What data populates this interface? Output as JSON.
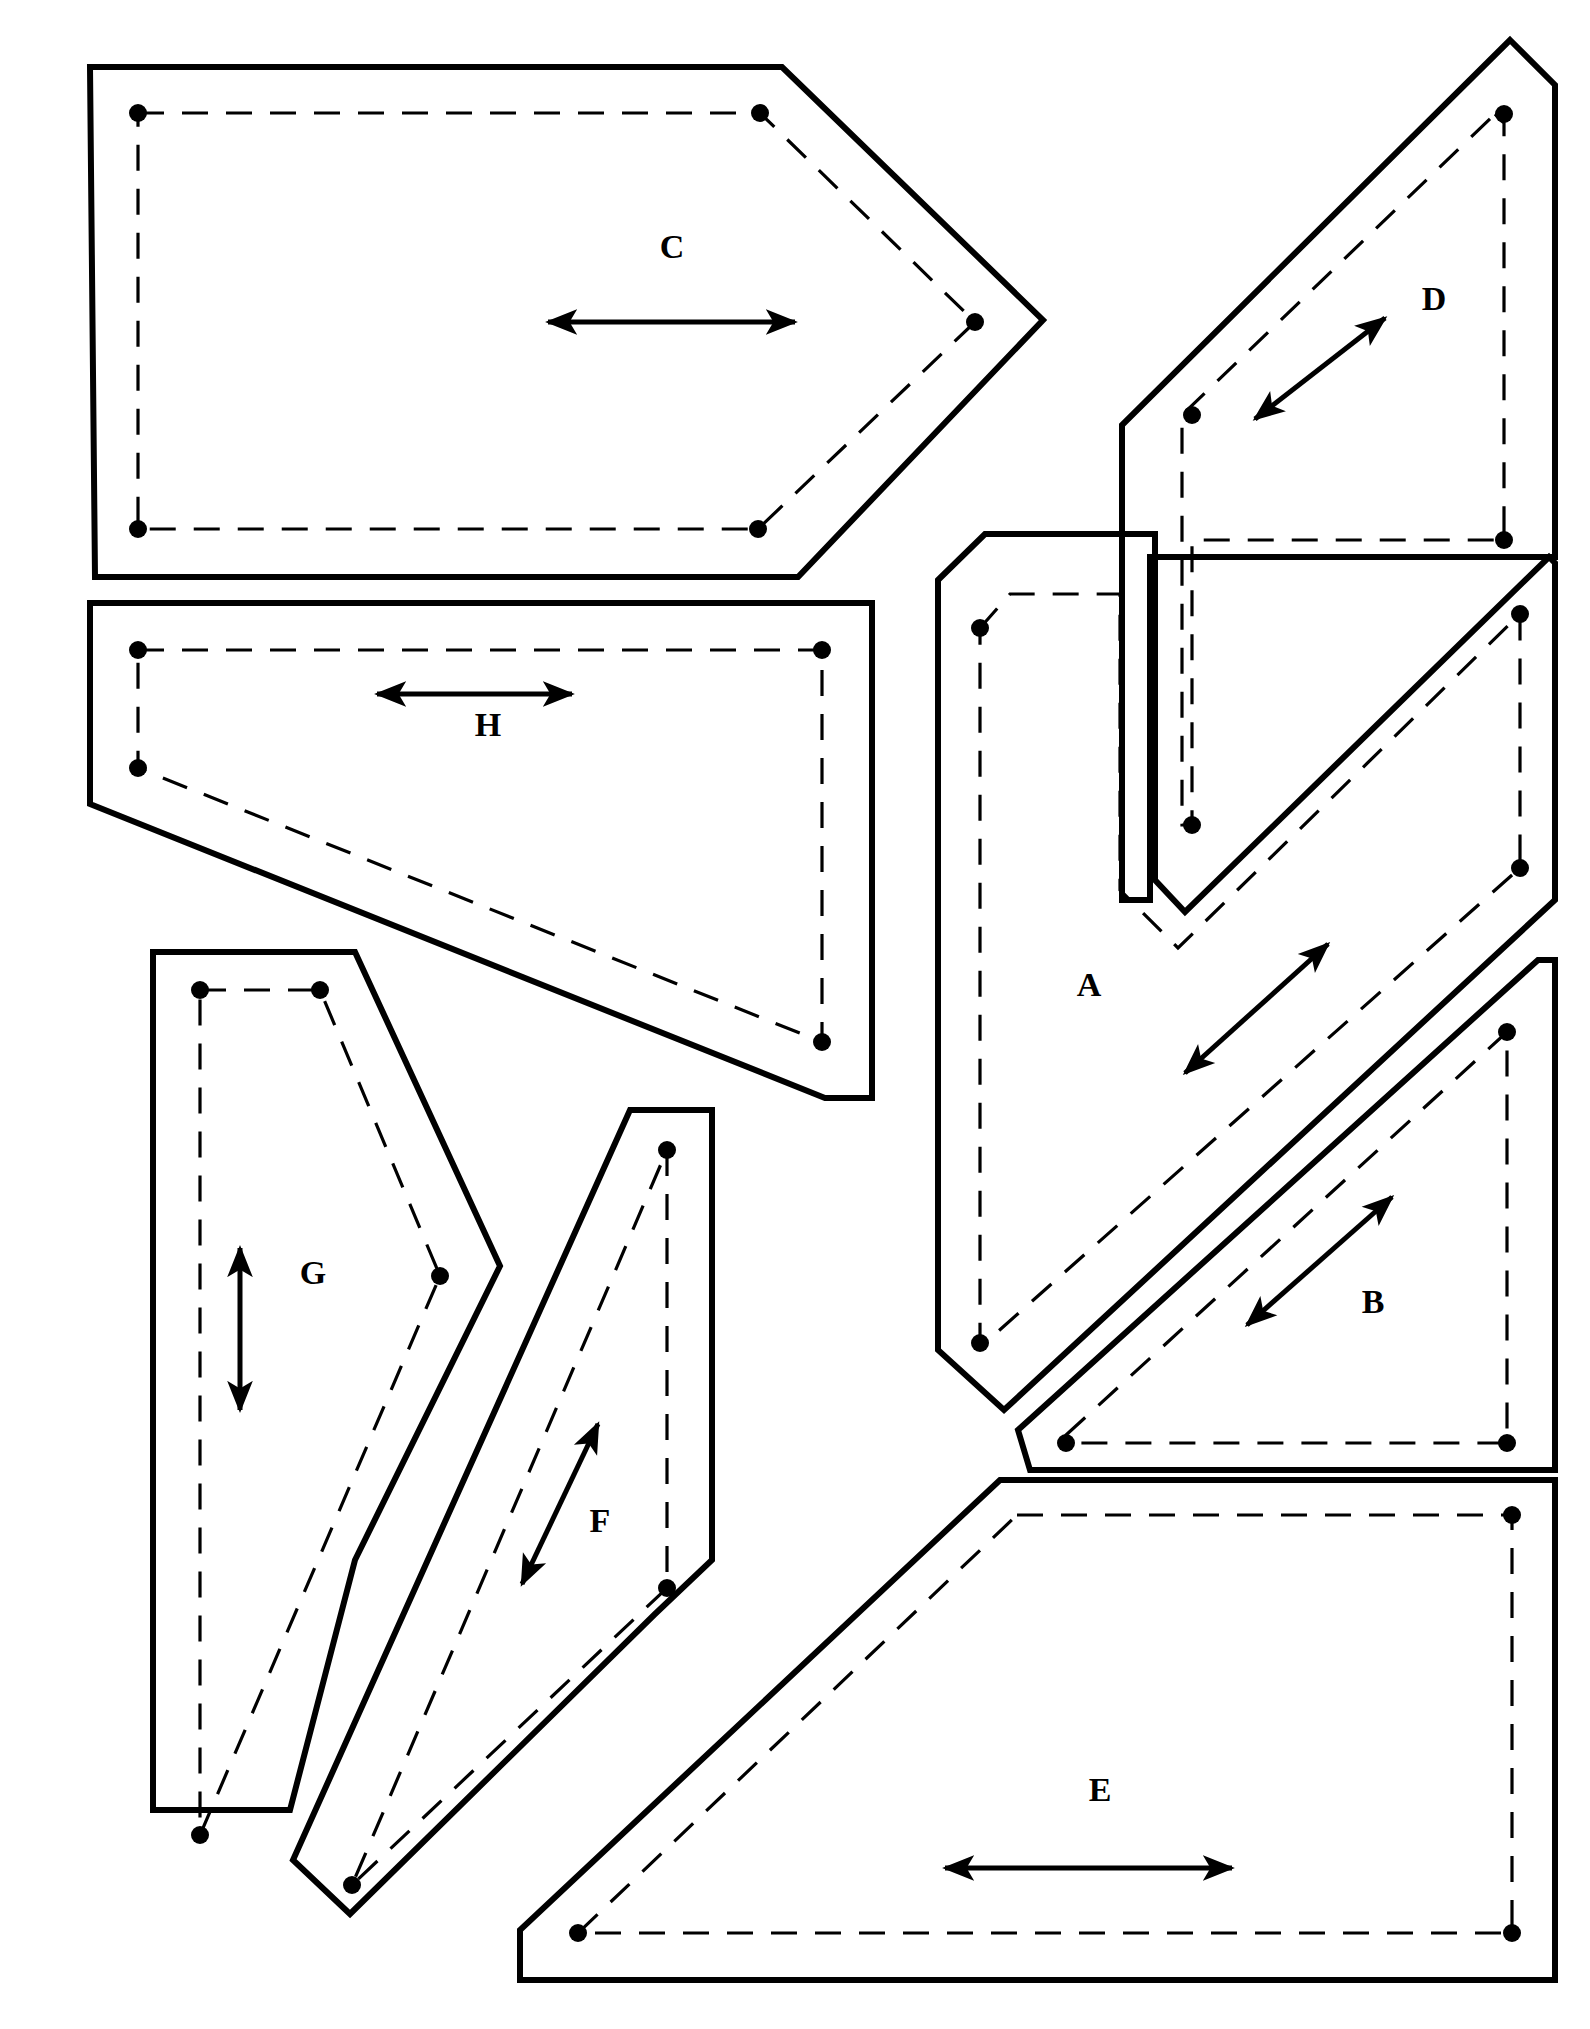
{
  "document": {
    "title": "Pattern Piece Cutting Layout",
    "background_color": "#ffffff",
    "line_color": "#000000",
    "width": 1590,
    "height": 2029
  },
  "legend": {
    "cut_line_style": "solid-heavy",
    "seam_line_style": "dashed",
    "marker_style": "filled-dot",
    "grain_line_style": "double-headed-arrow"
  },
  "pieces": [
    {
      "id": "C",
      "label": "C",
      "label_pos": {
        "x": 672,
        "y": 250
      },
      "cut_outline": "M 90,67 L 782,67 L 1043,320 L 798,577 L 95,577 Z",
      "seam_outline": "M 138,113 L 760,113 L 975,322 L 758,529 L 138,529 Z",
      "notches": [
        {
          "x": 138,
          "y": 113
        },
        {
          "x": 760,
          "y": 113
        },
        {
          "x": 975,
          "y": 322
        },
        {
          "x": 758,
          "y": 529
        },
        {
          "x": 138,
          "y": 529
        }
      ],
      "grain_arrow": {
        "x1": 548,
        "y1": 322,
        "x2": 795,
        "y2": 322
      }
    },
    {
      "id": "D",
      "label": "D",
      "label_pos": {
        "x": 1434,
        "y": 302
      },
      "cut_outline": "M 1510,40 L 1555,85 L 1555,557 L 1150,557 L 1150,900 L 1122,900 L 1122,425 Z",
      "seam_outline": "M 1495,114 L 1504,123 L 1504,540 L 1192,540 L 1192,825 L 1182,825 L 1182,415 Z",
      "notches": [
        {
          "x": 1504,
          "y": 114
        },
        {
          "x": 1504,
          "y": 540
        },
        {
          "x": 1192,
          "y": 415
        },
        {
          "x": 1192,
          "y": 825
        }
      ],
      "grain_arrow": {
        "x1": 1255,
        "y1": 419,
        "x2": 1385,
        "y2": 318
      }
    },
    {
      "id": "A",
      "label": "A",
      "label_pos": {
        "x": 1089,
        "y": 988
      },
      "cut_outline": "M 938,580 L 985,534 L 1155,534 L 1155,880 L 1185,912 L 1549,557 L 1555,563 L 1555,900 L 1004,1410 L 938,1350 Z",
      "seam_outline": "M 980,628 L 1010,594 L 1120,594 L 1120,890 L 1178,948 L 1520,614 L 1520,868 L 985,1343 L 980,1343 Z",
      "notches": [
        {
          "x": 980,
          "y": 628
        },
        {
          "x": 980,
          "y": 1343
        },
        {
          "x": 1520,
          "y": 614
        },
        {
          "x": 1520,
          "y": 868
        }
      ],
      "grain_arrow": {
        "x1": 1185,
        "y1": 1073,
        "x2": 1328,
        "y2": 944
      }
    },
    {
      "id": "B",
      "label": "B",
      "label_pos": {
        "x": 1373,
        "y": 1305
      },
      "cut_outline": "M 1018,1430 L 1538,960 L 1555,960 L 1555,1470 L 1030,1470 Z",
      "seam_outline": "M 1066,1435 L 1507,1032 L 1507,1443 L 1066,1443 Z",
      "notches": [
        {
          "x": 1507,
          "y": 1032
        },
        {
          "x": 1507,
          "y": 1443
        },
        {
          "x": 1066,
          "y": 1443
        }
      ],
      "grain_arrow": {
        "x1": 1247,
        "y1": 1325,
        "x2": 1392,
        "y2": 1197
      }
    },
    {
      "id": "E",
      "label": "E",
      "label_pos": {
        "x": 1100,
        "y": 1793
      },
      "cut_outline": "M 1000,1480 L 1555,1480 L 1555,1980 L 520,1980 L 520,1930 Z",
      "seam_outline": "M 1017,1515 L 1512,1515 L 1512,1933 L 578,1933 Z",
      "notches": [
        {
          "x": 1512,
          "y": 1515
        },
        {
          "x": 1512,
          "y": 1933
        },
        {
          "x": 578,
          "y": 1933
        }
      ],
      "grain_arrow": {
        "x1": 945,
        "y1": 1868,
        "x2": 1232,
        "y2": 1868
      }
    },
    {
      "id": "H",
      "label": "H",
      "label_pos": {
        "x": 488,
        "y": 728
      },
      "cut_outline": "M 90,603 L 872,603 L 872,1098 L 825,1098 L 90,804 Z",
      "seam_outline": "M 138,650 L 822,650 L 822,1042 L 138,768 Z",
      "notches": [
        {
          "x": 138,
          "y": 650
        },
        {
          "x": 822,
          "y": 650
        },
        {
          "x": 822,
          "y": 1042
        },
        {
          "x": 138,
          "y": 768
        }
      ],
      "grain_arrow": {
        "x1": 377,
        "y1": 694,
        "x2": 572,
        "y2": 694
      }
    },
    {
      "id": "G",
      "label": "G",
      "label_pos": {
        "x": 313,
        "y": 1276
      },
      "cut_outline": "M 153,952 L 355,952 L 500,1266 L 355,1560 L 290,1810 L 153,1810 Z",
      "seam_outline": "M 200,990 L 320,990 L 440,1276 L 200,1835 Z",
      "notches": [
        {
          "x": 200,
          "y": 990
        },
        {
          "x": 320,
          "y": 990
        },
        {
          "x": 440,
          "y": 1276
        },
        {
          "x": 200,
          "y": 1835
        }
      ],
      "grain_arrow": {
        "x1": 240,
        "y1": 1410,
        "x2": 240,
        "y2": 1248
      }
    },
    {
      "id": "F",
      "label": "F",
      "label_pos": {
        "x": 600,
        "y": 1524
      },
      "cut_outline": "M 630,1110 L 712,1110 L 712,1560 L 655,1614 L 350,1914 L 293,1860 Z",
      "seam_outline": "M 667,1150 L 667,1588 L 352,1885 Z",
      "notches": [
        {
          "x": 667,
          "y": 1150
        },
        {
          "x": 667,
          "y": 1588
        },
        {
          "x": 352,
          "y": 1885
        }
      ],
      "grain_arrow": {
        "x1": 522,
        "y1": 1584,
        "x2": 598,
        "y2": 1424
      }
    }
  ]
}
